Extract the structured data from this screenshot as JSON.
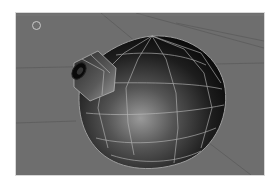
{
  "viewport": {
    "label": "3D perspective viewport",
    "shading_mode": "smooth shaded with wireframe",
    "object": "sphere mesh with extruded spout",
    "colors": {
      "background": "#6e6e6e",
      "grid_line": "#5a5a5a",
      "wire": "#bdbdbd",
      "mesh_dark": "#0e0e0e",
      "mesh_light": "#9a9a9a"
    },
    "icons": {
      "cursor": "3d-cursor-icon"
    }
  }
}
